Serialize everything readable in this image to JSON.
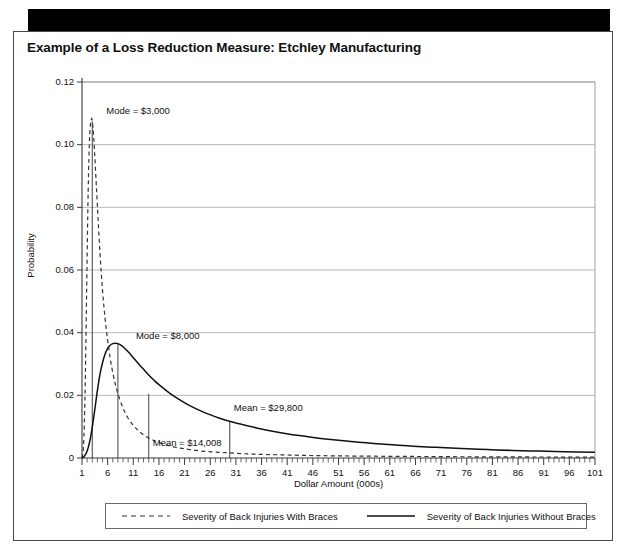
{
  "header": {
    "title": "Example of a Loss Reduction Measure: Etchley Manufacturing"
  },
  "chart_data": {
    "type": "line",
    "title": "Example of a Loss Reduction Measure: Etchley Manufacturing",
    "xlabel": "Dollar Amount (000s)",
    "ylabel": "Probability",
    "xlim": [
      1,
      101
    ],
    "ylim": [
      0,
      0.12
    ],
    "grid": true,
    "legend_position": "bottom",
    "y_ticks": [
      "0",
      "0.02",
      "0.04",
      "0.06",
      "0.08",
      "0.10",
      "0.12"
    ],
    "y_tick_values": [
      0,
      0.02,
      0.04,
      0.06,
      0.08,
      0.1,
      0.12
    ],
    "x_ticks": [
      "1",
      "6",
      "11",
      "16",
      "21",
      "26",
      "31",
      "36",
      "41",
      "46",
      "51",
      "56",
      "61",
      "66",
      "71",
      "76",
      "81",
      "86",
      "91",
      "96",
      "101"
    ],
    "x_tick_values": [
      1,
      6,
      11,
      16,
      21,
      26,
      31,
      36,
      41,
      46,
      51,
      56,
      61,
      66,
      71,
      76,
      81,
      86,
      91,
      96,
      101
    ],
    "x_minor_step": 1,
    "series": [
      {
        "name": "Severity of Back Injuries With Braces",
        "style": "dashed",
        "color": "#333333",
        "mode": 3,
        "mode_label": "Mode = $3,000",
        "mean": 14.008,
        "mean_label": "Mean = $14,008",
        "x": [
          1,
          1.3,
          1.6,
          1.9,
          2.2,
          2.5,
          2.8,
          3.0,
          3.3,
          3.6,
          4.0,
          4.5,
          5.0,
          5.5,
          6.0,
          6.5,
          7.0,
          7.5,
          8.0,
          9.0,
          10.0,
          11.0,
          12.0,
          13.0,
          14.0,
          15.0,
          16.0,
          18.0,
          20.0,
          22.0,
          25.0,
          28.0,
          31.0,
          35.0,
          40.0,
          45.0,
          50.0,
          55.0,
          60.0,
          65.0,
          70.0,
          75.0,
          80.0,
          85.0,
          90.0,
          95.0,
          101.0
        ],
        "y": [
          0.0,
          0.004,
          0.021,
          0.053,
          0.085,
          0.103,
          0.108,
          0.1075,
          0.102,
          0.093,
          0.0805,
          0.0655,
          0.0535,
          0.0445,
          0.0375,
          0.0318,
          0.0272,
          0.0235,
          0.0205,
          0.0159,
          0.0127,
          0.0104,
          0.0087,
          0.0074,
          0.0064,
          0.0056,
          0.0049,
          0.0039,
          0.0032,
          0.0027,
          0.0021,
          0.0018,
          0.0015,
          0.0012,
          0.001,
          0.0008,
          0.0007,
          0.0006,
          0.00055,
          0.0005,
          0.00045,
          0.0004,
          0.00038,
          0.00035,
          0.00032,
          0.0003,
          0.00028
        ]
      },
      {
        "name": "Severity of Back Injuries Without Braces",
        "style": "solid",
        "color": "#111111",
        "mode": 8,
        "mode_label": "Mode = $8,000",
        "mean": 29.8,
        "mean_label": "Mean = $29,800",
        "x": [
          1,
          1.5,
          2.0,
          2.5,
          3.0,
          3.5,
          4.0,
          4.5,
          5.0,
          5.5,
          6.0,
          6.5,
          7.0,
          7.5,
          8.0,
          8.5,
          9.0,
          10.0,
          11.0,
          12.0,
          13.0,
          14.0,
          15.0,
          16.0,
          18.0,
          20.0,
          22.0,
          25.0,
          28.0,
          29.8,
          31.0,
          35.0,
          40.0,
          45.0,
          50.0,
          55.0,
          60.0,
          65.0,
          70.0,
          75.0,
          80.0,
          85.0,
          90.0,
          95.0,
          101.0
        ],
        "y": [
          0.0,
          0.0006,
          0.0022,
          0.0052,
          0.0098,
          0.0155,
          0.0215,
          0.0267,
          0.0304,
          0.0332,
          0.035,
          0.036,
          0.0365,
          0.0366,
          0.0365,
          0.0361,
          0.0355,
          0.0339,
          0.032,
          0.0301,
          0.0283,
          0.0265,
          0.0249,
          0.0234,
          0.0208,
          0.0186,
          0.0167,
          0.0144,
          0.0126,
          0.0117,
          0.0112,
          0.0096,
          0.008,
          0.0068,
          0.0058,
          0.005,
          0.0044,
          0.0038,
          0.0034,
          0.003,
          0.0027,
          0.0024,
          0.0022,
          0.002,
          0.0018
        ]
      }
    ],
    "annotations": [
      {
        "text": "Mode = $3,000",
        "x": 3,
        "y": 0.108
      },
      {
        "text": "Mode = $8,000",
        "x": 8,
        "y": 0.0366
      },
      {
        "text": "Mean = $14,008",
        "x": 14.008,
        "y": 0.0
      },
      {
        "text": "Mean = $29,800",
        "x": 29.8,
        "y": 0.0117
      }
    ]
  },
  "legend": {
    "items": [
      {
        "label": "Severity of Back Injuries With Braces",
        "style": "dashed"
      },
      {
        "label": "Severity of Back Injuries Without Braces",
        "style": "solid"
      }
    ]
  }
}
